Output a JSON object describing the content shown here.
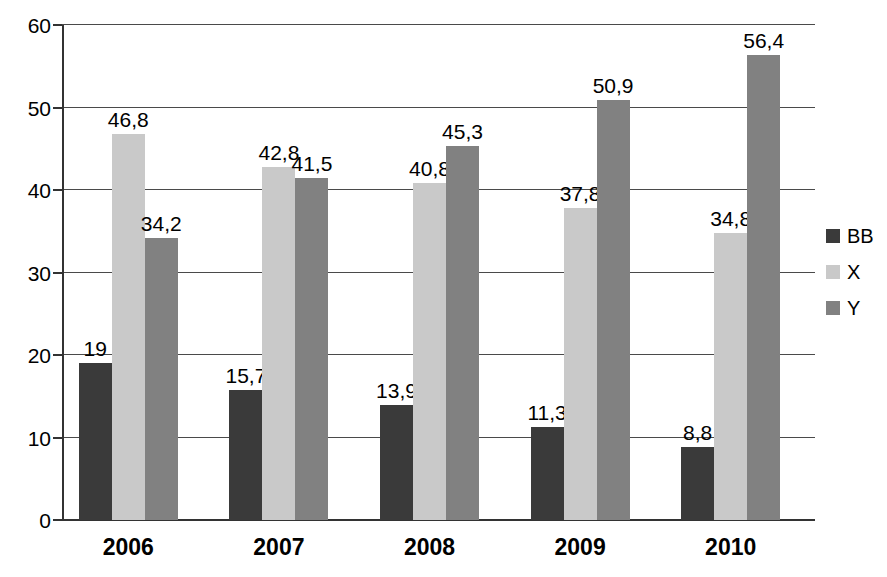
{
  "chart_data": {
    "type": "bar",
    "title": "",
    "subtitle": "",
    "xlabel": "",
    "ylabel": "",
    "categories": [
      "2006",
      "2007",
      "2008",
      "2009",
      "2010"
    ],
    "series": [
      {
        "name": "BB",
        "color": "#3a3a3a",
        "values": [
          19,
          15.7,
          13.9,
          11.3,
          8.8
        ],
        "labels": [
          "19",
          "15,7",
          "13,9",
          "11,3",
          "8,8"
        ]
      },
      {
        "name": "X",
        "color": "#c9c9c9",
        "values": [
          46.8,
          42.8,
          40.8,
          37.8,
          34.8
        ],
        "labels": [
          "46,8",
          "42,8",
          "40,8",
          "37,8",
          "34,8"
        ]
      },
      {
        "name": "Y",
        "color": "#818181",
        "values": [
          34.2,
          41.5,
          45.3,
          50.9,
          56.4
        ],
        "labels": [
          "34,2",
          "41,5",
          "45,3",
          "50,9",
          "56,4"
        ]
      }
    ],
    "ylim": [
      0,
      60
    ],
    "yticks": [
      0,
      10,
      20,
      30,
      40,
      50,
      60
    ],
    "ytick_labels": [
      "0",
      "10",
      "20",
      "30",
      "40",
      "50",
      "60"
    ],
    "grid": true,
    "grid_color": "#4a4a4a",
    "axis_color": "#333333",
    "background": "#ffffff",
    "legend": {
      "position": "right",
      "entries": [
        {
          "label": "BB",
          "color": "#3a3a3a",
          "swatch": "legend-swatch-bb"
        },
        {
          "label": "X",
          "color": "#c9c9c9",
          "swatch": "legend-swatch-x"
        },
        {
          "label": "Y",
          "color": "#818181",
          "swatch": "legend-swatch-y"
        }
      ]
    }
  }
}
